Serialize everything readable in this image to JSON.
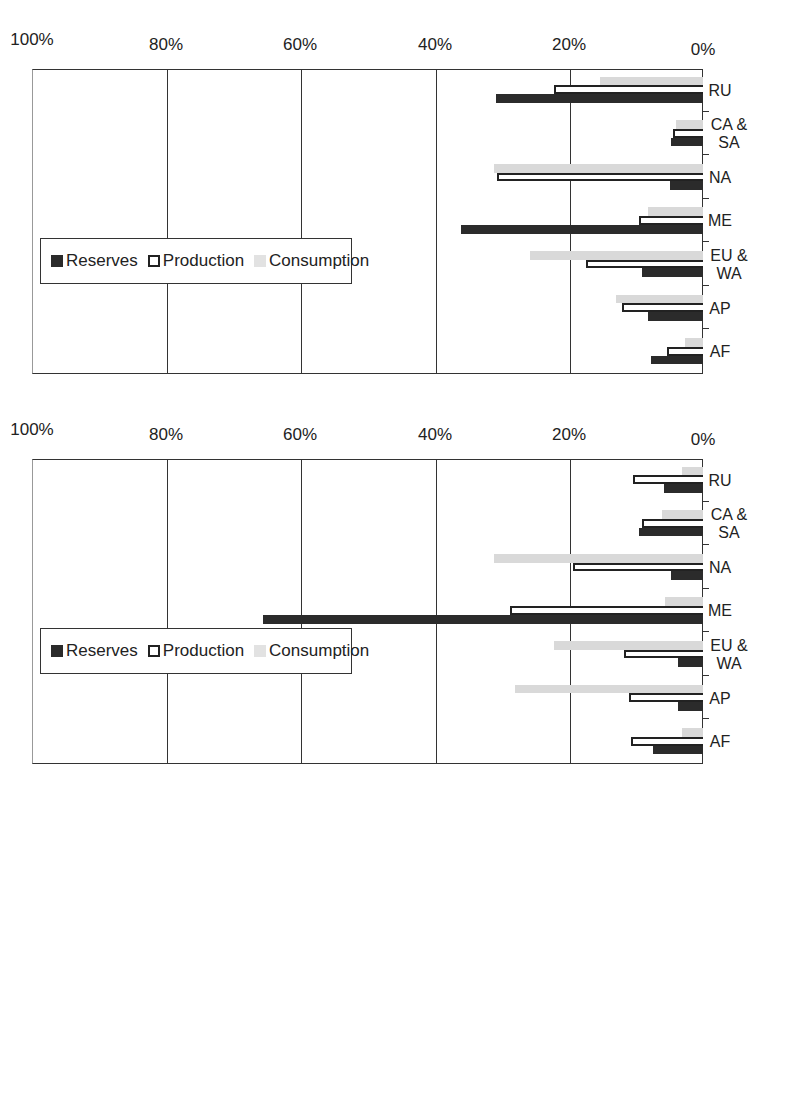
{
  "chart_data": [
    {
      "type": "bar",
      "title": "Natural gas",
      "orientation_note": "figure rotated 90deg on page",
      "categories": [
        "AF",
        "AP",
        "EU & WA",
        "ME",
        "NA",
        "CA & SA",
        "RU"
      ],
      "series": [
        {
          "name": "Reserves",
          "values": [
            7.8,
            8.2,
            9.1,
            36.0,
            4.9,
            4.7,
            30.8
          ]
        },
        {
          "name": "Production",
          "values": [
            5.4,
            12.0,
            17.4,
            9.6,
            30.7,
            4.4,
            22.2
          ]
        },
        {
          "name": "Consumption",
          "values": [
            2.7,
            12.9,
            25.8,
            8.2,
            31.2,
            4.1,
            15.3
          ]
        }
      ],
      "xlabel": "",
      "ylabel": "",
      "yticks": [
        "0%",
        "20%",
        "40%",
        "60%",
        "80%",
        "100%"
      ],
      "ylim": [
        0,
        100
      ],
      "grid": true,
      "legend_position": "top"
    },
    {
      "type": "bar",
      "title": "Petroleum",
      "categories": [
        "AF",
        "AP",
        "EU & WA",
        "ME",
        "NA",
        "CA & SA",
        "RU"
      ],
      "series": [
        {
          "name": "Reserves",
          "values": [
            7.5,
            3.8,
            3.7,
            65.6,
            4.8,
            9.5,
            5.8
          ]
        },
        {
          "name": "Production",
          "values": [
            10.8,
            11.1,
            11.8,
            28.7,
            19.4,
            9.1,
            10.5
          ]
        },
        {
          "name": "Consumption",
          "values": [
            3.1,
            28.0,
            22.2,
            5.7,
            31.2,
            6.1,
            3.1
          ]
        }
      ],
      "xlabel": "",
      "ylabel": "",
      "yticks": [
        "0%",
        "20%",
        "40%",
        "60%",
        "80%",
        "100%"
      ],
      "ylim": [
        0,
        100
      ],
      "grid": true,
      "legend_position": "top"
    }
  ],
  "legend": {
    "reserves": "Reserves",
    "production": "Production",
    "consumption": "Consumption"
  },
  "colors": {
    "reserves": "#2b2b2b",
    "production": "#ffffff",
    "consumption": "#d9d9d9"
  }
}
